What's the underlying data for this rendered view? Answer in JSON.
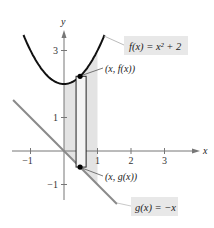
{
  "diagram": {
    "axes": {
      "x_label": "x",
      "y_label": "y",
      "x_ticks": [
        {
          "value": -1,
          "label": "−1"
        },
        {
          "value": 1,
          "label": "1"
        },
        {
          "value": 2,
          "label": "2"
        },
        {
          "value": 3,
          "label": "3"
        }
      ],
      "y_ticks": [
        {
          "value": 3,
          "label": "3"
        },
        {
          "value": 1,
          "label": "1"
        },
        {
          "value": -1,
          "label": "−1"
        }
      ],
      "x_range": [
        -1.5,
        3.6
      ],
      "y_range": [
        -1.6,
        3.6
      ]
    },
    "functions": {
      "f": {
        "label": "f(x) = x² + 2",
        "domain": [
          -1.21,
          1.21
        ],
        "color": "#111111"
      },
      "g": {
        "label": "g(x) = −x",
        "domain": [
          -1.52,
          1.58
        ],
        "color": "#8a8a8a"
      }
    },
    "shaded_region": {
      "x_from": 0,
      "x_to": 1,
      "color": "#e3e3e3"
    },
    "representative_rectangle": {
      "x_left": 0.36,
      "x_right": 0.66,
      "sample_x": 0.48
    },
    "points": {
      "upper": {
        "label": "(x, f(x))"
      },
      "lower": {
        "label": "(x, g(x))"
      }
    }
  }
}
